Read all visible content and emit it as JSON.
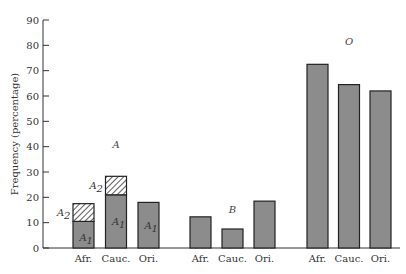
{
  "chart_data": {
    "type": "bar",
    "title": "",
    "xlabel": "",
    "ylabel": "Frequency (percentage)",
    "ylim": [
      0,
      90
    ],
    "yticks": [
      0,
      10,
      20,
      30,
      40,
      50,
      60,
      70,
      80,
      90
    ],
    "grid": false,
    "legend": "none",
    "groups": [
      {
        "name": "A",
        "categories": [
          "Afr.",
          "Cauc.",
          "Ori."
        ],
        "stacked_segments": [
          {
            "category": "Afr.",
            "segments": [
              {
                "label": "A1",
                "value": 10.5,
                "style": "solid"
              },
              {
                "label": "A2",
                "value": 7.0,
                "style": "hatched"
              }
            ]
          },
          {
            "category": "Cauc.",
            "segments": [
              {
                "label": "A1",
                "value": 21.0,
                "style": "solid"
              },
              {
                "label": "A2",
                "value": 7.3,
                "style": "hatched"
              }
            ]
          },
          {
            "category": "Ori.",
            "segments": [
              {
                "label": "A1",
                "value": 18.0,
                "style": "solid"
              }
            ]
          }
        ]
      },
      {
        "name": "B",
        "categories": [
          "Afr.",
          "Cauc.",
          "Ori."
        ],
        "values": [
          12.3,
          7.5,
          18.5
        ]
      },
      {
        "name": "O",
        "categories": [
          "Afr.",
          "Cauc.",
          "Ori."
        ],
        "values": [
          72.5,
          64.5,
          62.0
        ]
      }
    ],
    "segment_label_text": {
      "A1": "A",
      "A1_sub": "1",
      "A2": "A",
      "A2_sub": "2"
    },
    "colors": {
      "bar_fill": "#8c8c8c",
      "bar_stroke": "#222222",
      "hatch": "#333333",
      "axis": "#333333"
    }
  }
}
